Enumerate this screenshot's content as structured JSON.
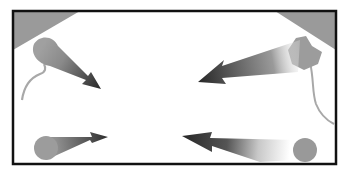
{
  "diagram": {
    "colors": {
      "frame": "#111111",
      "corner_wedge": "#9a9a9a",
      "source_shape": "#9c9c9c",
      "arrow_dark": "#2e2e2e",
      "background": "#ffffff"
    },
    "frame": {
      "x": 12,
      "y": 10,
      "width": 325,
      "height": 155
    },
    "arrows": [
      {
        "id": "top-left",
        "source": "microphone-like rounded shape",
        "direction": "down-right"
      },
      {
        "id": "top-right",
        "source": "angular gray shape",
        "direction": "down-left"
      },
      {
        "id": "bottom-left",
        "source": "circle",
        "direction": "right"
      },
      {
        "id": "bottom-right",
        "source": "circle",
        "direction": "left"
      }
    ]
  }
}
